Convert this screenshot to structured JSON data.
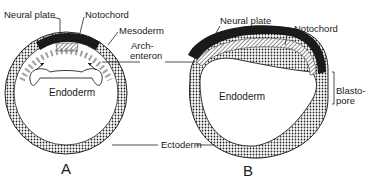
{
  "diagram": {
    "panels": [
      {
        "id": "A",
        "label": "A",
        "labels": {
          "neural_plate": "Neural plate",
          "notochord": "Notochord",
          "mesoderm": "Mesoderm",
          "endoderm": "Endoderm",
          "ectoderm": "Ectoderm"
        }
      },
      {
        "id": "B",
        "label": "B",
        "labels": {
          "neural_plate": "Neural plate",
          "notochord": "Notochord",
          "endoderm": "Endoderm",
          "blastopore_line1": "Blasto-",
          "blastopore_line2": "pore"
        }
      }
    ],
    "shared_labels": {
      "archenteron_line1": "Arch-",
      "archenteron_line2": "enteron"
    },
    "colors": {
      "ink": "#1a1a1a",
      "background": "#ffffff"
    }
  }
}
